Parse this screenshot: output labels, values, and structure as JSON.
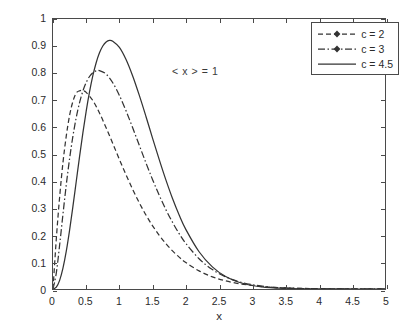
{
  "chart_data": {
    "type": "line",
    "title": "",
    "xlabel": "x",
    "ylabel": "Probability density function",
    "xlim": [
      0,
      5
    ],
    "ylim": [
      0,
      1
    ],
    "xticks": [
      "0",
      "0.5",
      "1",
      "1.5",
      "2",
      "2.5",
      "3",
      "3.5",
      "4",
      "4.5",
      "5"
    ],
    "yticks": [
      "0",
      "0.1",
      "0.2",
      "0.3",
      "0.4",
      "0.5",
      "0.6",
      "0.7",
      "0.8",
      "0.9",
      "1"
    ],
    "grid": false,
    "legend_position": "top-right",
    "annotations": [
      {
        "text": "< x > = 1",
        "x": 1.82,
        "y": 0.83
      }
    ],
    "series": [
      {
        "name": "c = 2",
        "style": "dashed-marker",
        "color": "#333333",
        "peak_x": 0.45,
        "peak_y": 0.735,
        "x": [
          0,
          0.05,
          0.1,
          0.15,
          0.2,
          0.25,
          0.3,
          0.35,
          0.4,
          0.45,
          0.5,
          0.6,
          0.7,
          0.8,
          0.9,
          1.0,
          1.1,
          1.2,
          1.3,
          1.4,
          1.5,
          1.6,
          1.7,
          1.8,
          1.9,
          2.0,
          2.2,
          2.4,
          2.6,
          2.8,
          3.0,
          3.2,
          3.4,
          3.6,
          3.8,
          4.0,
          4.3,
          4.6,
          5.0
        ],
        "y": [
          0,
          0.186,
          0.341,
          0.468,
          0.567,
          0.643,
          0.695,
          0.726,
          0.734,
          0.735,
          0.728,
          0.698,
          0.652,
          0.597,
          0.539,
          0.48,
          0.423,
          0.369,
          0.319,
          0.274,
          0.234,
          0.199,
          0.168,
          0.141,
          0.118,
          0.098,
          0.067,
          0.045,
          0.03,
          0.02,
          0.013,
          0.008,
          0.005,
          0.003,
          0.002,
          0.0013,
          0.0006,
          0.0003,
          0.0001
        ]
      },
      {
        "name": "c = 3",
        "style": "dash-dot-marker",
        "color": "#333333",
        "peak_x": 0.63,
        "peak_y": 0.81,
        "x": [
          0,
          0.05,
          0.1,
          0.15,
          0.2,
          0.25,
          0.3,
          0.35,
          0.4,
          0.45,
          0.5,
          0.55,
          0.6,
          0.65,
          0.7,
          0.8,
          0.9,
          1.0,
          1.1,
          1.2,
          1.3,
          1.4,
          1.5,
          1.6,
          1.7,
          1.8,
          1.9,
          2.0,
          2.2,
          2.4,
          2.6,
          2.8,
          3.0,
          3.2,
          3.4,
          3.6,
          3.8,
          4.0,
          4.3,
          4.6,
          5.0
        ],
        "y": [
          0,
          0.06,
          0.163,
          0.277,
          0.386,
          0.483,
          0.566,
          0.635,
          0.69,
          0.733,
          0.765,
          0.787,
          0.801,
          0.808,
          0.809,
          0.796,
          0.764,
          0.717,
          0.66,
          0.597,
          0.532,
          0.467,
          0.405,
          0.347,
          0.294,
          0.247,
          0.205,
          0.169,
          0.112,
          0.072,
          0.045,
          0.027,
          0.016,
          0.009,
          0.005,
          0.003,
          0.0015,
          0.0008,
          0.0003,
          0.0001,
          3e-05
        ]
      },
      {
        "name": "c = 4.5",
        "style": "solid",
        "color": "#333333",
        "peak_x": 0.76,
        "peak_y": 0.94,
        "x": [
          0,
          0.05,
          0.1,
          0.15,
          0.2,
          0.25,
          0.3,
          0.35,
          0.4,
          0.45,
          0.5,
          0.55,
          0.6,
          0.65,
          0.7,
          0.75,
          0.8,
          0.85,
          0.9,
          1.0,
          1.1,
          1.2,
          1.3,
          1.4,
          1.5,
          1.6,
          1.7,
          1.8,
          1.9,
          2.0,
          2.2,
          2.4,
          2.6,
          2.8,
          3.0,
          3.2,
          3.4,
          3.6,
          3.8,
          4.0,
          4.3,
          4.6,
          5.0
        ],
        "y": [
          0,
          0.007,
          0.032,
          0.077,
          0.14,
          0.218,
          0.306,
          0.398,
          0.49,
          0.578,
          0.659,
          0.73,
          0.79,
          0.838,
          0.875,
          0.9,
          0.915,
          0.921,
          0.918,
          0.895,
          0.85,
          0.789,
          0.717,
          0.639,
          0.558,
          0.479,
          0.404,
          0.335,
          0.274,
          0.221,
          0.138,
          0.082,
          0.046,
          0.025,
          0.013,
          0.006,
          0.003,
          0.0013,
          0.0006,
          0.0002,
          6e-05,
          1e-05,
          2e-06
        ]
      }
    ],
    "legend": [
      {
        "label": "c = 2",
        "style": "dashed-marker"
      },
      {
        "label": "c = 3",
        "style": "dash-dot-marker"
      },
      {
        "label": "c = 4.5",
        "style": "solid"
      }
    ]
  },
  "axis": {
    "x_title": "x",
    "y_title": "Probability density function"
  },
  "colors": {
    "line": "#333333",
    "axis": "#4a4a4a",
    "text": "#2b2b2b"
  }
}
